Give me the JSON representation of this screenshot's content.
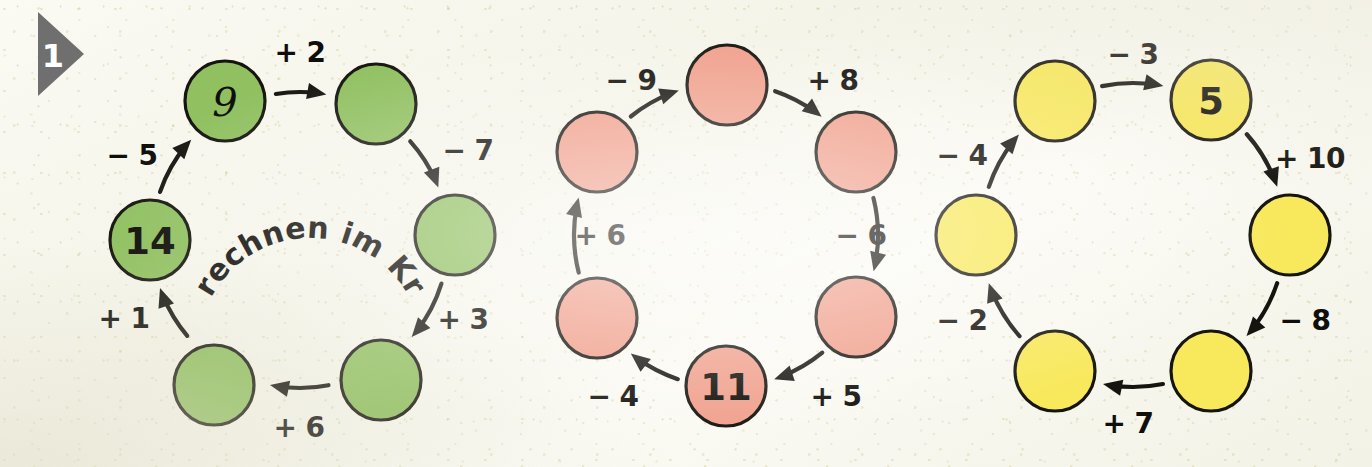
{
  "exercise": {
    "marker_number": "1",
    "marker_icon": "triangle-pennant-icon"
  },
  "caption": {
    "text": "Wir rechnen im Kreis."
  },
  "colors": {
    "green": "#90c060",
    "green_stroke": "#16140f",
    "red": "#f0a08c",
    "red_stroke": "#16140f",
    "yellow": "#f8e85c",
    "yellow_stroke": "#16140f",
    "ink": "#100e0a",
    "paper": "#f7f6ec",
    "marker_gray": "#6f6f6f"
  },
  "chart_data": {
    "type": "diagram",
    "title": "Wir rechnen im Kreis.",
    "cycles": [
      {
        "name": "green-cycle",
        "color": "#90c060",
        "center": [
          300,
          240
        ],
        "radius": 148,
        "node_radius": 40,
        "nodes": [
          {
            "id": "g1",
            "label": "9",
            "filled": true,
            "style": "script",
            "cx": 225,
            "cy": 101
          },
          {
            "id": "g2",
            "label": "",
            "filled": false,
            "style": "plain",
            "cx": 376,
            "cy": 104
          },
          {
            "id": "g3",
            "label": "",
            "filled": false,
            "style": "plain",
            "cx": 455,
            "cy": 235
          },
          {
            "id": "g4",
            "label": "",
            "filled": false,
            "style": "plain",
            "cx": 381,
            "cy": 380
          },
          {
            "id": "g5",
            "label": "",
            "filled": false,
            "style": "plain",
            "cx": 214,
            "cy": 385
          },
          {
            "id": "g6",
            "label": "14",
            "filled": true,
            "style": "plain",
            "cx": 150,
            "cy": 240
          }
        ],
        "edges": [
          {
            "from": "g1",
            "to": "g2",
            "label": "+ 2",
            "lx": 300,
            "ly": 52
          },
          {
            "from": "g2",
            "to": "g3",
            "label": "− 7",
            "lx": 468,
            "ly": 150
          },
          {
            "from": "g3",
            "to": "g4",
            "label": "+ 3",
            "lx": 463,
            "ly": 319
          },
          {
            "from": "g4",
            "to": "g5",
            "label": "+ 6",
            "lx": 299,
            "ly": 427
          },
          {
            "from": "g5",
            "to": "g6",
            "label": "+ 1",
            "lx": 124,
            "ly": 318
          },
          {
            "from": "g6",
            "to": "g1",
            "label": "− 5",
            "lx": 132,
            "ly": 155
          }
        ]
      },
      {
        "name": "red-cycle",
        "color": "#f0a08c",
        "center": [
          726,
          235
        ],
        "radius": 152,
        "node_radius": 40,
        "nodes": [
          {
            "id": "r1",
            "label": "",
            "filled": false,
            "style": "plain",
            "cx": 727,
            "cy": 85
          },
          {
            "id": "r2",
            "label": "",
            "filled": false,
            "style": "plain",
            "cx": 856,
            "cy": 152
          },
          {
            "id": "r3",
            "label": "",
            "filled": false,
            "style": "plain",
            "cx": 856,
            "cy": 317
          },
          {
            "id": "r4",
            "label": "11",
            "filled": true,
            "style": "plain",
            "cx": 726,
            "cy": 386
          },
          {
            "id": "r5",
            "label": "",
            "filled": false,
            "style": "plain",
            "cx": 597,
            "cy": 318
          },
          {
            "id": "r6",
            "label": "",
            "filled": false,
            "style": "plain",
            "cx": 597,
            "cy": 152
          }
        ],
        "edges": [
          {
            "from": "r6",
            "to": "r1",
            "label": "− 9",
            "lx": 631,
            "ly": 80
          },
          {
            "from": "r1",
            "to": "r2",
            "label": "+ 8",
            "lx": 833,
            "ly": 80
          },
          {
            "from": "r2",
            "to": "r3",
            "label": "− 6",
            "lx": 861,
            "ly": 235
          },
          {
            "from": "r3",
            "to": "r4",
            "label": "+ 5",
            "lx": 836,
            "ly": 396
          },
          {
            "from": "r4",
            "to": "r5",
            "label": "− 4",
            "lx": 613,
            "ly": 396
          },
          {
            "from": "r5",
            "to": "r6",
            "label": "+ 6",
            "lx": 600,
            "ly": 235
          }
        ]
      },
      {
        "name": "yellow-cycle",
        "color": "#f8e85c",
        "center": [
          1133,
          235
        ],
        "radius": 152,
        "node_radius": 40,
        "nodes": [
          {
            "id": "y1",
            "label": "",
            "filled": false,
            "style": "plain",
            "cx": 1055,
            "cy": 101
          },
          {
            "id": "y2",
            "label": "5",
            "filled": true,
            "style": "plain",
            "cx": 1211,
            "cy": 100
          },
          {
            "id": "y3",
            "label": "",
            "filled": false,
            "style": "plain",
            "cx": 1290,
            "cy": 235
          },
          {
            "id": "y4",
            "label": "",
            "filled": false,
            "style": "plain",
            "cx": 1211,
            "cy": 371
          },
          {
            "id": "y5",
            "label": "",
            "filled": false,
            "style": "plain",
            "cx": 1055,
            "cy": 371
          },
          {
            "id": "y6",
            "label": "",
            "filled": false,
            "style": "plain",
            "cx": 976,
            "cy": 235
          }
        ],
        "edges": [
          {
            "from": "y1",
            "to": "y2",
            "label": "− 3",
            "lx": 1133,
            "ly": 54
          },
          {
            "from": "y2",
            "to": "y3",
            "label": "+ 10",
            "lx": 1310,
            "ly": 158
          },
          {
            "from": "y3",
            "to": "y4",
            "label": "− 8",
            "lx": 1305,
            "ly": 320
          },
          {
            "from": "y4",
            "to": "y5",
            "label": "+ 7",
            "lx": 1128,
            "ly": 423
          },
          {
            "from": "y5",
            "to": "y6",
            "label": "− 2",
            "lx": 962,
            "ly": 320
          },
          {
            "from": "y6",
            "to": "y1",
            "label": "− 4",
            "lx": 962,
            "ly": 155
          }
        ]
      }
    ]
  }
}
